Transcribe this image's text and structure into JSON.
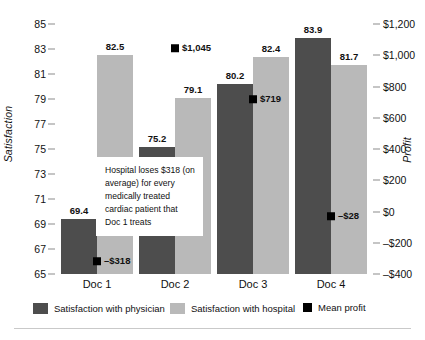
{
  "chart_data": {
    "type": "bar",
    "title": "",
    "subtitle": "",
    "categories": [
      "Doc 1",
      "Doc 2",
      "Doc 3",
      "Doc 4"
    ],
    "xlabel": "",
    "ylabel": "Satisfaction",
    "y2label": "Profit",
    "ylim": [
      65,
      85
    ],
    "y2lim": [
      -400,
      1200
    ],
    "grid": false,
    "legend_position": "bottom",
    "series": [
      {
        "name": "Satisfaction with physician",
        "axis": "left",
        "type": "bar",
        "color": "#4d4d4d",
        "values": [
          69.4,
          75.2,
          80.2,
          83.9
        ],
        "labels": [
          "69.4",
          "75.2",
          "80.2",
          "83.9"
        ]
      },
      {
        "name": "Satisfaction with hospital",
        "axis": "left",
        "type": "bar",
        "color": "#b9b9b9",
        "values": [
          82.5,
          79.1,
          82.4,
          81.7
        ],
        "labels": [
          "82.5",
          "79.1",
          "82.4",
          "81.7"
        ]
      },
      {
        "name": "Mean profit",
        "axis": "right",
        "type": "marker",
        "color": "#000000",
        "values": [
          -318,
          1045,
          719,
          -28
        ],
        "labels": [
          "–$318",
          "$1,045",
          "$719",
          "–$28"
        ]
      }
    ],
    "left_ticks": [
      "85",
      "83",
      "81",
      "79",
      "77",
      "75",
      "73",
      "71",
      "69",
      "67",
      "65"
    ],
    "right_ticks": [
      "$1,200",
      "$1,000",
      "$800",
      "$600",
      "$400",
      "$200",
      "$0",
      "–$200",
      "–$400"
    ],
    "annotations": [
      {
        "name": "doc1-profit-callout",
        "text": "Hospital loses $318 (on average) for every medically treated cardiac patient that Doc 1 treats"
      }
    ]
  },
  "legend": {
    "items": [
      {
        "label": "Satisfaction with physician",
        "color": "#4d4d4d",
        "shape": "rect"
      },
      {
        "label": "Satisfaction with hospital",
        "color": "#b9b9b9",
        "shape": "rect"
      },
      {
        "label": "Mean profit",
        "color": "#000000",
        "shape": "square-small"
      }
    ]
  }
}
